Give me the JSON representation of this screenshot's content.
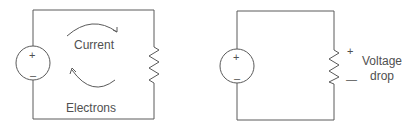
{
  "diagram": {
    "left_circuit": {
      "source": {
        "plus": "+",
        "minus": "–"
      },
      "labels": {
        "current": "Current",
        "electrons": "Electrons"
      }
    },
    "right_circuit": {
      "source": {
        "plus": "+",
        "minus": "–"
      },
      "resistor_polarity": {
        "plus": "+",
        "minus": "—"
      },
      "label_line1": "Voltage",
      "label_line2": "drop"
    },
    "colors": {
      "stroke": "#5a5a5a",
      "text": "#505050",
      "background": "#ffffff"
    }
  }
}
